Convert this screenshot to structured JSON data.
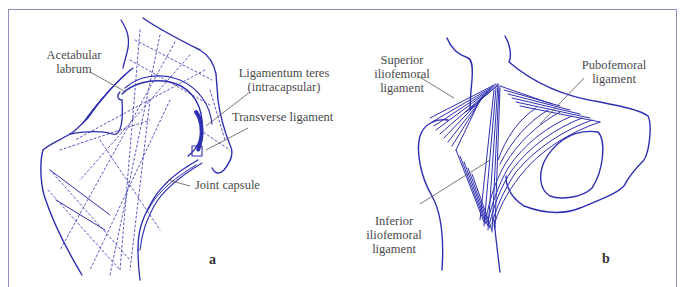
{
  "figure": {
    "panels": [
      {
        "letter": "a",
        "labels": {
          "acetabular_labrum_1": "Acetabular",
          "acetabular_labrum_2": "labrum",
          "ligamentum_teres_1": "Ligamentum teres",
          "ligamentum_teres_2": "(intracapsular)",
          "transverse_ligament": "Transverse ligament",
          "joint_capsule": "Joint capsule"
        }
      },
      {
        "letter": "b",
        "labels": {
          "superior_iliofemoral_1": "Superior",
          "superior_iliofemoral_2": "iliofemoral",
          "superior_iliofemoral_3": "ligament",
          "pubofemoral_1": "Pubofemoral",
          "pubofemoral_2": "ligament",
          "inferior_iliofemoral_1": "Inferior",
          "inferior_iliofemoral_2": "iliofemoral",
          "inferior_iliofemoral_3": "ligament"
        }
      }
    ],
    "colors": {
      "ink": "#2d2fb0",
      "leader": "#555555",
      "frame": "#8d8fc4"
    }
  }
}
